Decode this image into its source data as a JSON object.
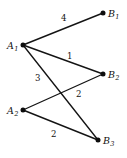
{
  "diagram": {
    "type": "weighted-bipartite-graph",
    "width": 127,
    "height": 158,
    "background_color": "#ffffff",
    "ink_color": "#111111",
    "left_nodes": [
      {
        "id": "A1",
        "base": "A",
        "sub": "1",
        "x": 23,
        "y": 45,
        "label_x": 7,
        "label_y": 41
      },
      {
        "id": "A2",
        "base": "A",
        "sub": "2",
        "x": 23,
        "y": 110,
        "label_x": 7,
        "label_y": 106
      }
    ],
    "right_nodes": [
      {
        "id": "B1",
        "base": "B",
        "sub": "1",
        "x": 103,
        "y": 13,
        "label_x": 108,
        "label_y": 9
      },
      {
        "id": "B2",
        "base": "B",
        "sub": "2",
        "x": 103,
        "y": 74,
        "label_x": 108,
        "label_y": 70
      },
      {
        "id": "B3",
        "base": "B",
        "sub": "3",
        "x": 98,
        "y": 140,
        "label_x": 103,
        "label_y": 136
      }
    ],
    "edges": [
      {
        "id": "A1-B1",
        "from": "A1",
        "to": "B1",
        "weight": "4",
        "label_x": 61,
        "label_y": 14
      },
      {
        "id": "A1-B2",
        "from": "A1",
        "to": "B2",
        "weight": "1",
        "label_x": 67,
        "label_y": 52
      },
      {
        "id": "A1-B3",
        "from": "A1",
        "to": "B3",
        "weight": "3",
        "label_x": 35,
        "label_y": 74
      },
      {
        "id": "A2-B2",
        "from": "A2",
        "to": "B2",
        "weight": "2",
        "label_x": 76,
        "label_y": 90
      },
      {
        "id": "A2-B3",
        "from": "A2",
        "to": "B3",
        "weight": "2",
        "label_x": 51,
        "label_y": 130
      }
    ]
  },
  "chart_data": {
    "type": "diagram",
    "title": "",
    "nodes": [
      "A1",
      "A2",
      "B1",
      "B2",
      "B3"
    ],
    "edges": [
      {
        "source": "A1",
        "target": "B1",
        "weight": 4
      },
      {
        "source": "A1",
        "target": "B2",
        "weight": 1
      },
      {
        "source": "A1",
        "target": "B3",
        "weight": 3
      },
      {
        "source": "A2",
        "target": "B2",
        "weight": 2
      },
      {
        "source": "A2",
        "target": "B3",
        "weight": 2
      }
    ]
  }
}
